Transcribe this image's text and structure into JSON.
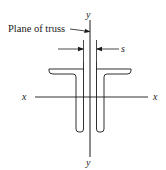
{
  "diagram": {
    "type": "cross-section",
    "labels": {
      "plane": "Plane of truss",
      "spacing": "s",
      "x_axis_left": "x",
      "x_axis_right": "x",
      "y_axis_top": "y",
      "y_axis_bottom": "y"
    },
    "colors": {
      "line": "#1a1a1a",
      "background": "#ffffff"
    }
  }
}
